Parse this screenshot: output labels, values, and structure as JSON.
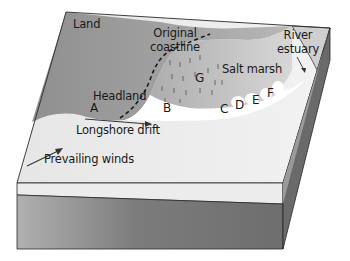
{
  "diagram": {
    "type": "block diagram",
    "labels": {
      "land": "Land",
      "original_coastline": [
        "Original",
        "coastline"
      ],
      "headland": "Headland",
      "salt_marsh": "Salt marsh",
      "river_estuary": [
        "River",
        "estuary"
      ],
      "longshore_drift": "Longshore drift",
      "prevailing_winds": "Prevailing winds"
    },
    "points": [
      "A",
      "B",
      "C",
      "D",
      "E",
      "F",
      "G"
    ],
    "arrows": [
      {
        "name": "longshore-drift-arrow",
        "direction": "east"
      },
      {
        "name": "prevailing-winds-arrow",
        "direction": "north-east"
      },
      {
        "name": "river-estuary-pointer",
        "direction": "south"
      }
    ],
    "colors": {
      "land": "#9a9a9a",
      "sea": "#e8e8e8",
      "marsh": "#b5b5b5",
      "spit": "#ffffff",
      "front_face_light": "#eaeaea",
      "front_face_dark": "#7a7a7a",
      "side_face": "#666666",
      "outline": "#2a2a2a"
    }
  }
}
